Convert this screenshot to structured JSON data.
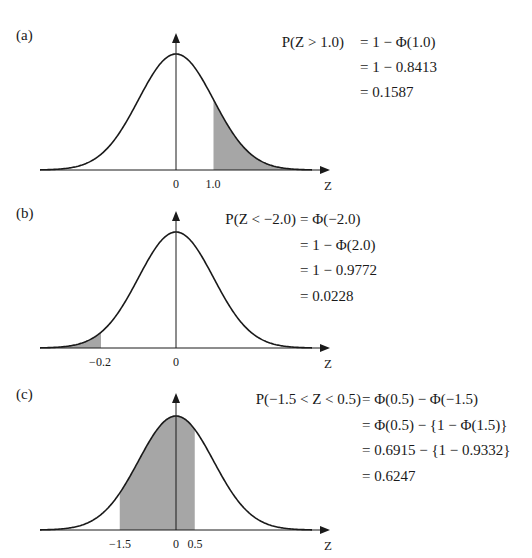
{
  "panels": [
    {
      "label": "(a)",
      "shade": "right-tail",
      "ticks": [
        {
          "text": "0",
          "z": 0
        },
        {
          "text": "1.0",
          "z": 1.0
        }
      ],
      "axis_label": "Z",
      "equation": {
        "lhs": "P(Z > 1.0)",
        "lines": [
          "= 1 − Φ(1.0)",
          "= 1 − 0.8413",
          "= 0.1587"
        ]
      }
    },
    {
      "label": "(b)",
      "shade": "left-tail",
      "ticks": [
        {
          "text": "−0.2",
          "z": -2.0
        },
        {
          "text": "0",
          "z": 0
        }
      ],
      "axis_label": "Z",
      "equation": {
        "lhs": "P(Z < −2.0)",
        "lines": [
          "= Φ(−2.0)",
          "= 1 − Φ(2.0)",
          "= 1 − 0.9772",
          "= 0.0228"
        ]
      }
    },
    {
      "label": "(c)",
      "shade": "interval",
      "ticks": [
        {
          "text": "−1.5",
          "z": -1.5
        },
        {
          "text": "0",
          "z": 0
        },
        {
          "text": "0.5",
          "z": 0.5
        }
      ],
      "axis_label": "Z",
      "equation": {
        "lhs": "P(−1.5 < Z < 0.5)",
        "lines": [
          "= Φ(0.5) − Φ(−1.5)",
          "= Φ(0.5) − {1 − Φ(1.5)}",
          "= 0.6915 − {1 − 0.9332}",
          "= 0.6247"
        ]
      }
    }
  ],
  "colors": {
    "curve": "#1a1a1a",
    "shade": "#a6a6a6",
    "background": "#ffffff"
  },
  "chart_data": [
    {
      "type": "area",
      "title": "(a) P(Z > 1.0)",
      "xlabel": "Z",
      "distribution": "standard normal",
      "shaded_region": {
        "from": 1.0,
        "to": "inf"
      },
      "tick_labels": [
        "0",
        "1.0"
      ],
      "probability": 0.1587
    },
    {
      "type": "area",
      "title": "(b) P(Z < −2.0)",
      "xlabel": "Z",
      "distribution": "standard normal",
      "shaded_region": {
        "from": "-inf",
        "to": -2.0
      },
      "tick_labels": [
        "−0.2",
        "0"
      ],
      "probability": 0.0228
    },
    {
      "type": "area",
      "title": "(c) P(−1.5 < Z < 0.5)",
      "xlabel": "Z",
      "distribution": "standard normal",
      "shaded_region": {
        "from": -1.5,
        "to": 0.5
      },
      "tick_labels": [
        "−1.5",
        "0",
        "0.5"
      ],
      "probability": 0.6247
    }
  ]
}
